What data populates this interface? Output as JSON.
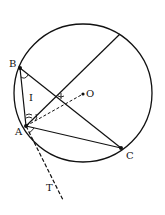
{
  "diagram": {
    "type": "geometry-circle",
    "circle": {
      "center_label": "O",
      "cx": 83,
      "cy": 93,
      "r": 69
    },
    "points": [
      {
        "label": "B",
        "x": 20,
        "y": 68
      },
      {
        "label": "A",
        "x": 26,
        "y": 126
      },
      {
        "label": "C",
        "x": 121,
        "y": 148
      },
      {
        "label": "O",
        "x": 83,
        "y": 94
      },
      {
        "label": "T",
        "x": 62,
        "y": 198
      }
    ],
    "labels": {
      "B": "B",
      "A": "A",
      "C": "C",
      "O": "O",
      "I": "I",
      "T": "T"
    },
    "segments": [
      {
        "from": "A",
        "to": "B",
        "style": "solid"
      },
      {
        "from": "B",
        "to": "C",
        "style": "solid"
      },
      {
        "from": "A",
        "to": "C",
        "style": "solid"
      },
      {
        "from": "A",
        "to": "chord-end",
        "style": "solid"
      },
      {
        "from": "A",
        "to": "O",
        "style": "dashed"
      },
      {
        "from": "A",
        "to": "T",
        "style": "dashed",
        "note": "tangent line at A"
      }
    ],
    "colors": {
      "stroke": "#111111",
      "background": "#ffffff"
    }
  }
}
